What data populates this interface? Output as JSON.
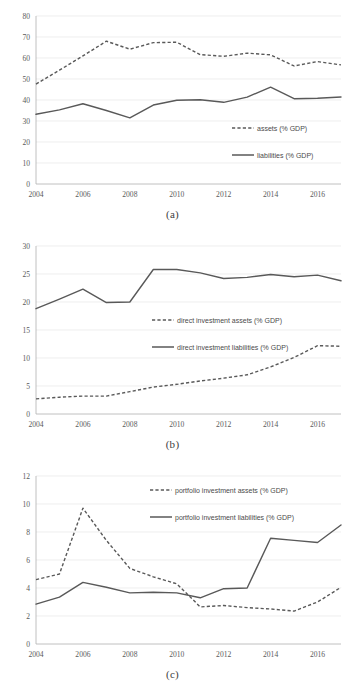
{
  "figure": {
    "panels": [
      {
        "caption": "(a)",
        "chart_data": {
          "type": "line",
          "title": "",
          "xlabel": "",
          "ylabel": "",
          "x": [
            2004,
            2005,
            2006,
            2007,
            2008,
            2009,
            2010,
            2011,
            2012,
            2013,
            2014,
            2015,
            2016,
            2017
          ],
          "xlim": [
            2004,
            2017
          ],
          "ylim": [
            0,
            80
          ],
          "yticks": [
            0,
            10,
            20,
            30,
            40,
            50,
            60,
            70,
            80
          ],
          "xticks": [
            2004,
            2006,
            2008,
            2010,
            2012,
            2014,
            2016
          ],
          "grid": true,
          "legend_position": "inside-right",
          "series": [
            {
              "name": "assets (% GDP)",
              "style": "dashed",
              "values": [
                47.6,
                54.2,
                61.0,
                68.0,
                64.2,
                67.3,
                67.5,
                61.6,
                60.8,
                62.3,
                61.5,
                56.2,
                58.3,
                56.7
              ]
            },
            {
              "name": "liabilities (% GDP)",
              "style": "solid",
              "values": [
                33.2,
                35.3,
                38.2,
                35.0,
                31.5,
                37.6,
                39.9,
                40.1,
                38.9,
                41.4,
                46.1,
                40.6,
                40.8,
                41.4
              ]
            }
          ]
        }
      },
      {
        "caption": "(b)",
        "chart_data": {
          "type": "line",
          "title": "",
          "xlabel": "",
          "ylabel": "",
          "x": [
            2004,
            2005,
            2006,
            2007,
            2008,
            2009,
            2010,
            2011,
            2012,
            2013,
            2014,
            2015,
            2016,
            2017
          ],
          "xlim": [
            2004,
            2017
          ],
          "ylim": [
            0,
            30
          ],
          "yticks": [
            0,
            5,
            10,
            15,
            20,
            25,
            30
          ],
          "xticks": [
            2004,
            2006,
            2008,
            2010,
            2012,
            2014,
            2016
          ],
          "grid": true,
          "legend_position": "inside-center",
          "series": [
            {
              "name": "direct investment assets (% GDP)",
              "style": "dashed",
              "values": [
                2.7,
                3.0,
                3.2,
                3.2,
                4.0,
                4.8,
                5.3,
                5.9,
                6.4,
                7.0,
                8.4,
                10.1,
                12.2,
                12.1
              ]
            },
            {
              "name": "direct investment liabilities (% GDP)",
              "style": "solid",
              "values": [
                18.8,
                20.5,
                22.3,
                19.9,
                20.0,
                25.8,
                25.8,
                25.2,
                24.2,
                24.4,
                24.9,
                24.5,
                24.8,
                23.8
              ]
            }
          ]
        }
      },
      {
        "caption": "(c)",
        "chart_data": {
          "type": "line",
          "title": "",
          "xlabel": "",
          "ylabel": "",
          "x": [
            2004,
            2005,
            2006,
            2007,
            2008,
            2009,
            2010,
            2011,
            2012,
            2013,
            2014,
            2015,
            2016,
            2017
          ],
          "xlim": [
            2004,
            2017
          ],
          "ylim": [
            0,
            12
          ],
          "yticks": [
            0,
            2,
            4,
            6,
            8,
            10,
            12
          ],
          "xticks": [
            2004,
            2006,
            2008,
            2010,
            2012,
            2014,
            2016
          ],
          "grid": true,
          "legend_position": "inside-top-right",
          "series": [
            {
              "name": "portfolio investment assets (% GDP)",
              "style": "dashed",
              "values": [
                4.6,
                5.0,
                9.7,
                7.4,
                5.4,
                4.8,
                4.3,
                2.65,
                2.75,
                2.6,
                2.5,
                2.35,
                3.0,
                4.05
              ]
            },
            {
              "name": "portfolio investment liabilities (% GDP)",
              "style": "solid",
              "values": [
                2.85,
                3.35,
                4.4,
                4.05,
                3.65,
                3.7,
                3.65,
                3.3,
                3.95,
                4.0,
                7.55,
                7.4,
                7.25,
                8.5
              ]
            }
          ]
        }
      }
    ]
  }
}
